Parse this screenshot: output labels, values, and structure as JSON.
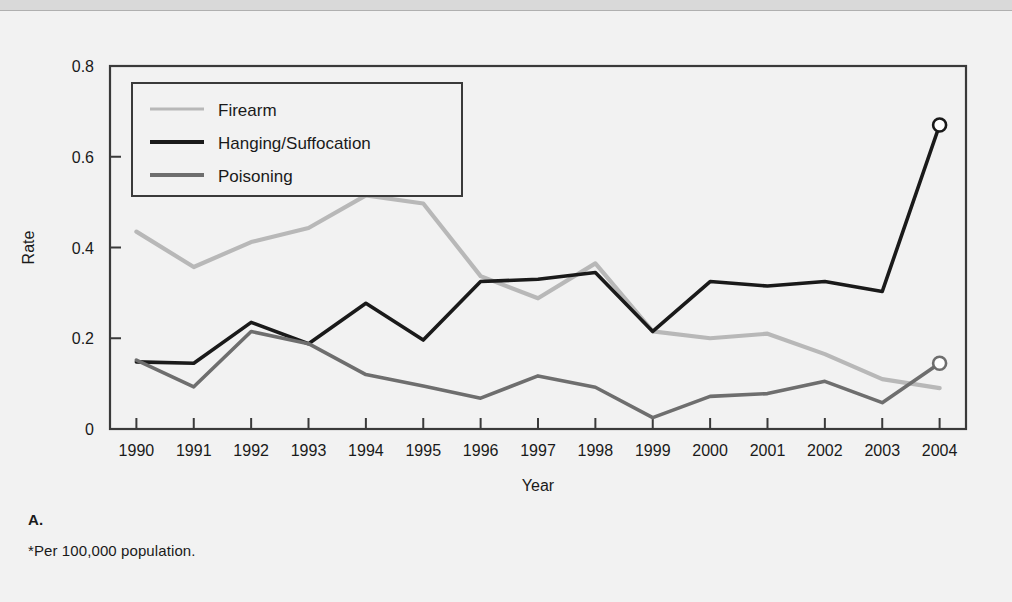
{
  "figure": {
    "panel_label": "A.",
    "footnote": "*Per 100,000 population."
  },
  "colors": {
    "background": "#f2f2f2",
    "top_band": "#d9d9d9",
    "axis": "#3a3a3a",
    "text": "#1a1a1a",
    "firearm": "#b8b8b8",
    "hanging": "#1a1a1a",
    "poisoning": "#6e6e6e",
    "marker_fill": "#ffffff"
  },
  "chart_data": {
    "type": "line",
    "title": "",
    "xlabel": "Year",
    "ylabel": "Rate",
    "xlim": [
      1990,
      2004
    ],
    "ylim": [
      0,
      0.8
    ],
    "yticks": [
      "0",
      "0.2",
      "0.4",
      "0.6",
      "0.8"
    ],
    "ytick_values": [
      0,
      0.2,
      0.4,
      0.6,
      0.8
    ],
    "grid": false,
    "legend_position": "top-left",
    "categories": [
      1990,
      1991,
      1992,
      1993,
      1994,
      1995,
      1996,
      1997,
      1998,
      1999,
      2000,
      2001,
      2002,
      2003,
      2004
    ],
    "xtick_labels": [
      "1990",
      "1991",
      "1992",
      "1993",
      "1994",
      "1995",
      "1996",
      "1997",
      "1998",
      "1999",
      "2000",
      "2001",
      "2002",
      "2003",
      "2004"
    ],
    "series": [
      {
        "name": "Firearm",
        "color": "#b8b8b8",
        "values": [
          0.435,
          0.357,
          0.412,
          0.443,
          0.515,
          0.497,
          0.337,
          0.288,
          0.365,
          0.215,
          0.2,
          0.21,
          0.165,
          0.11,
          0.09
        ],
        "endpoint_marker": false
      },
      {
        "name": "Hanging/Suffocation",
        "color": "#1a1a1a",
        "values": [
          0.148,
          0.145,
          0.235,
          0.188,
          0.277,
          0.196,
          0.325,
          0.33,
          0.345,
          0.215,
          0.325,
          0.315,
          0.325,
          0.303,
          0.67
        ],
        "endpoint_marker": true,
        "endpoint_value": 0.67
      },
      {
        "name": "Poisoning",
        "color": "#6e6e6e",
        "values": [
          0.152,
          0.093,
          0.215,
          0.188,
          0.12,
          0.095,
          0.068,
          0.117,
          0.092,
          0.025,
          0.072,
          0.078,
          0.105,
          0.058,
          0.145
        ],
        "endpoint_marker": true,
        "endpoint_value": 0.145
      }
    ]
  },
  "legend": {
    "items": [
      {
        "label": "Firearm",
        "color": "#b8b8b8",
        "weight": 3
      },
      {
        "label": "Hanging/Suffocation",
        "color": "#1a1a1a",
        "weight": 4
      },
      {
        "label": "Poisoning",
        "color": "#6e6e6e",
        "weight": 4
      }
    ]
  }
}
